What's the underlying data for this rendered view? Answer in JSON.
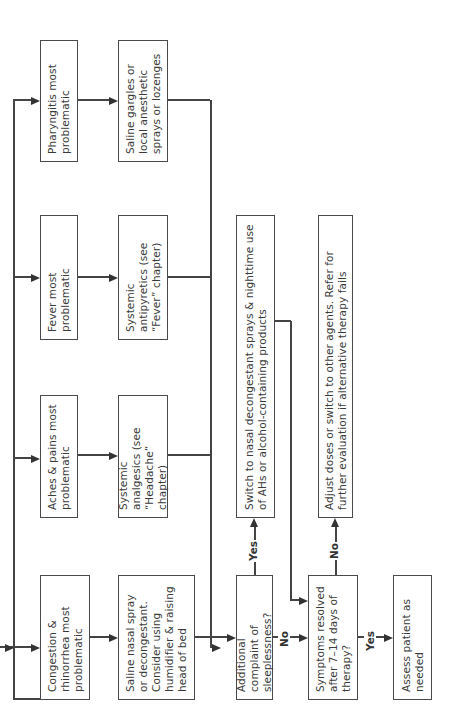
{
  "flowchart": {
    "orientation": "rotated -90deg (text reads bottom-to-top)",
    "symptom_boxes": {
      "congestion": "Congestion & rhinorrhea most problematic",
      "aches": "Aches & pains most problematic",
      "fever": "Fever most problematic",
      "pharyngitis": "Pharyngitis most problematic"
    },
    "treatment_boxes": {
      "congestion": "Saline nasal spray or decongestant. Consider using humidifier & raising head of bed",
      "aches": "Systemic analgesics (see “Headache” chapter)",
      "fever": "Systemic antipyretics (see “Fever” chapter)",
      "pharyngitis": "Saline gargles or local anesthetic sprays or lozenges"
    },
    "decision_sleeplessness": "Additional complaint of sleeplessness?",
    "sleeplessness_yes_action": "Switch to nasal decongestant sprays & nighttime use of AHs or alcohol-containing products",
    "decision_resolved": "Symptoms resolved after 7–14 days of therapy?",
    "resolved_no_action": "Adjust doses or switch to other agents. Refer for further evaluation if alternative therapy fails",
    "resolved_yes_action": "Assess patient as needed",
    "labels": {
      "yes": "Yes",
      "no": "No"
    },
    "colors": {
      "border": "#4a4a4a",
      "text": "#3a3a3a",
      "background": "#ffffff"
    }
  }
}
